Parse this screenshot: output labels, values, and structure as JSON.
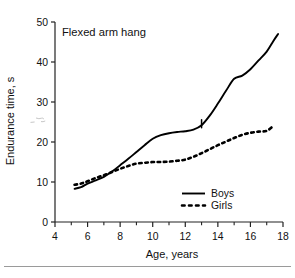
{
  "chart_data": {
    "type": "line",
    "title": "Flexed arm hang",
    "xlabel": "Age, years",
    "ylabel": "Endurance time, s",
    "xlim": [
      4,
      18
    ],
    "ylim": [
      0,
      50
    ],
    "xticks": [
      4,
      6,
      8,
      10,
      12,
      14,
      16,
      18
    ],
    "xticks_minor": [
      5,
      7,
      9,
      11,
      13,
      15,
      17
    ],
    "yticks": [
      0,
      10,
      20,
      30,
      40,
      50
    ],
    "grid": false,
    "legend_position": "lower-right",
    "series": [
      {
        "name": "Boys",
        "style": "solid",
        "color": "#000000",
        "x": [
          5.2,
          5.6,
          6.0,
          6.5,
          7.0,
          7.5,
          8.0,
          8.5,
          9.0,
          9.5,
          10.0,
          10.5,
          11.0,
          11.5,
          12.0,
          12.5,
          13.0,
          13.5,
          14.0,
          14.5,
          15.0,
          15.5,
          16.0,
          16.5,
          17.0,
          17.4,
          17.7
        ],
        "y": [
          8.3,
          8.7,
          9.6,
          10.4,
          11.3,
          12.6,
          14.2,
          15.8,
          17.5,
          19.2,
          20.8,
          21.7,
          22.2,
          22.5,
          22.7,
          23.1,
          24.2,
          26.6,
          29.6,
          32.8,
          35.8,
          36.6,
          38.2,
          40.4,
          42.6,
          45.2,
          47.0
        ]
      },
      {
        "name": "Girls",
        "style": "dashed",
        "color": "#000000",
        "x": [
          5.2,
          5.6,
          6.0,
          6.5,
          7.0,
          7.5,
          8.0,
          8.5,
          9.0,
          9.5,
          10.0,
          10.5,
          11.0,
          11.5,
          12.0,
          12.5,
          13.0,
          13.5,
          14.0,
          14.5,
          15.0,
          15.5,
          16.0,
          16.5,
          17.0,
          17.4
        ],
        "y": [
          9.3,
          9.6,
          10.2,
          11.0,
          11.7,
          12.5,
          13.3,
          14.0,
          14.6,
          14.8,
          15.0,
          15.0,
          15.1,
          15.3,
          15.6,
          16.3,
          17.2,
          18.2,
          19.2,
          20.1,
          21.0,
          21.8,
          22.3,
          22.6,
          22.8,
          24.0
        ]
      }
    ],
    "annotations": [
      {
        "name": "boys-marker-tick",
        "x": 13.0,
        "y": 24.2,
        "kind": "vertical-tick"
      }
    ]
  },
  "legend": {
    "entries": [
      {
        "label": "Boys",
        "style": "solid"
      },
      {
        "label": "Girls",
        "style": "dashed"
      }
    ]
  },
  "axis_labels": {
    "x": "Age, years",
    "y": "Endurance time, s"
  },
  "tick_text": {
    "x": [
      "4",
      "6",
      "8",
      "10",
      "12",
      "14",
      "16",
      "18"
    ],
    "y": [
      "0",
      "10",
      "20",
      "30",
      "40",
      "50"
    ]
  },
  "colors": {
    "ink": "#111111",
    "line": "#000000",
    "axis": "#222222",
    "rule": "#9a9a9a",
    "background": "#ffffff"
  }
}
